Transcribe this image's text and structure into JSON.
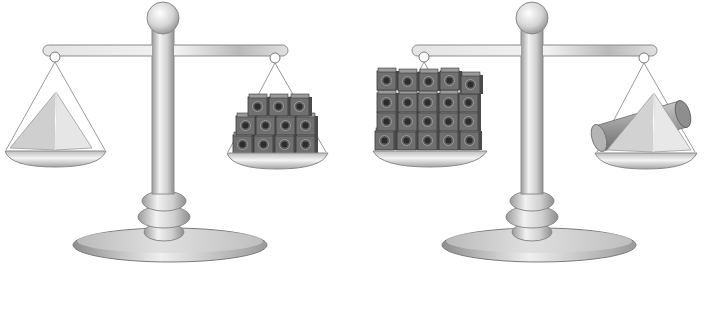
{
  "figure": {
    "background": "#ffffff",
    "metal_colors": {
      "light": "#f2f2f2",
      "mid": "#c9c9c9",
      "dark": "#8e8e8e",
      "outline": "#777777"
    },
    "cube_colors": {
      "face": "#6e6e6e",
      "light": "#9a9a9a",
      "dark": "#3c3c3c",
      "hole": "#2a2a2a"
    },
    "solid_colors": {
      "pyramid_light": "#e4e4e4",
      "pyramid_dark": "#c4c4c4",
      "cylinder": "#a8a8a8"
    }
  },
  "scales": [
    {
      "id": "scale-1",
      "state": "balanced",
      "left_pan": {
        "contents": "pyramid",
        "label": "1 pyramid"
      },
      "right_pan": {
        "contents": "unit cubes",
        "cube_rows": [
          3,
          4,
          4
        ],
        "label": "11 cubes"
      }
    },
    {
      "id": "scale-2",
      "state": "balanced",
      "left_pan": {
        "contents": "unit cubes",
        "cube_rows": [
          5,
          5,
          5,
          5
        ],
        "label": "20 cubes"
      },
      "right_pan": {
        "contents": "pyramid and cylinder",
        "label": "1 pyramid + 1 cylinder"
      }
    }
  ]
}
